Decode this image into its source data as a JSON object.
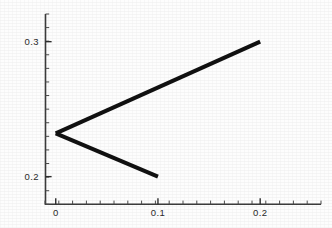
{
  "chart_data": {
    "type": "line",
    "title": "",
    "subtitle": "",
    "xlabel": "",
    "ylabel": "",
    "xlim": [
      -0.0105,
      0.2595
    ],
    "ylim": [
      0.1795,
      0.3205
    ],
    "grid": false,
    "legend": null,
    "background_color": "#fdfdfd",
    "line_color": "#111111",
    "axis_color": "#3b3b3b",
    "line_width_px": 4,
    "xticks": [
      0,
      0.1,
      0.2
    ],
    "xtick_labels": [
      "0",
      "0.1",
      "0.2"
    ],
    "yticks": [
      0.2,
      0.3
    ],
    "ytick_labels": [
      "0.2",
      "0.3"
    ],
    "x_minor_tick_count": 20,
    "y_minor_tick_count": 14,
    "annotations": [],
    "series": [
      {
        "name": "upper-branch",
        "x": [
          0,
          0.2
        ],
        "values": [
          0.232,
          0.3
        ]
      },
      {
        "name": "lower-branch",
        "x": [
          0,
          0.1
        ],
        "values": [
          0.232,
          0.2
        ]
      }
    ],
    "vertex": {
      "x": 0,
      "y": 0.232
    }
  },
  "axes": {
    "y_axis_name": "y-axis-line",
    "x_axis_name": "x-axis-line"
  }
}
